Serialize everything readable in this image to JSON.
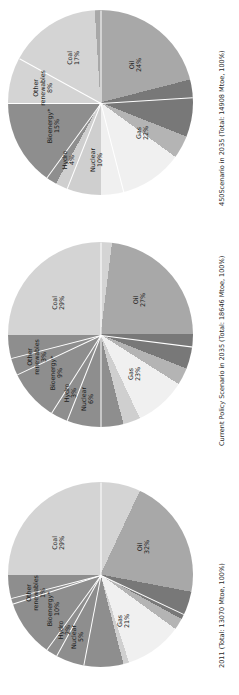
{
  "figure": {
    "orientation": "rotated-90-ccw",
    "background": "#ffffff",
    "footnote_marker": "*"
  },
  "palette": {
    "oil": "#d4d4d4",
    "gas": "#a8a8a8",
    "nuclear": "#787878",
    "hydro": "#b4b4b4",
    "bioenergy": "#f0f0f0",
    "other_renewables": "#cfcfcf",
    "coal": "#8e8e8e",
    "label_text": "#1b1b1b",
    "caption_text": "#2a2a2a",
    "slice_edge": "#ffffff"
  },
  "chart_data": [
    {
      "type": "pie",
      "id": "chart-450-scenario-2035",
      "title": "450Scenario in 2035 (Total: 14908 Mtoe, 100%)",
      "caption": "450Scenario in 2035 (Total: 14908 Mtoe, 100%)",
      "scenario": "450 Scenario",
      "year": "2035",
      "total": "14908",
      "total_unit": "Mtoe",
      "total_share": "100%",
      "categories": [
        "Oil",
        "Gas",
        "Nuclear",
        "Hydro",
        "Bioenergy*",
        "Other renewables",
        "Coal"
      ],
      "values": [
        24,
        22,
        10,
        4,
        15,
        8,
        17
      ],
      "labels": [
        {
          "name": "Oil",
          "value": "24%"
        },
        {
          "name": "Gas",
          "value": "22%"
        },
        {
          "name": "Nuclear",
          "value": "10%"
        },
        {
          "name": "Hydro",
          "value": "4%"
        },
        {
          "name": "Bioenergy*",
          "value": "15%"
        },
        {
          "name": "Other renewables",
          "value": "8%"
        },
        {
          "name": "Coal",
          "value": "17%"
        }
      ],
      "legend": "none",
      "grid": false
    },
    {
      "type": "pie",
      "id": "chart-current-policy-2035",
      "title": "Current Policy Scenario in 2035 (Total: 18646 Mtoe, 100%)",
      "caption": "Current Policy Scenario in 2035 (Total: 18646 Mtoe, 100%)",
      "scenario": "Current Policy Scenario",
      "year": "2035",
      "total": "18646",
      "total_unit": "Mtoe",
      "total_share": "100%",
      "categories": [
        "Oil",
        "Gas",
        "Nuclear",
        "Hydro",
        "Bioenergy*",
        "Other renewables",
        "Coal"
      ],
      "values": [
        27,
        23,
        6,
        3,
        9,
        3,
        29
      ],
      "labels": [
        {
          "name": "Oil",
          "value": "27%"
        },
        {
          "name": "Gas",
          "value": "23%"
        },
        {
          "name": "Nuclear",
          "value": "6%"
        },
        {
          "name": "Hydro",
          "value": "3%"
        },
        {
          "name": "Bioenergy*",
          "value": "9%"
        },
        {
          "name": "Other renewables",
          "value": "3%"
        },
        {
          "name": "Coal",
          "value": "29%"
        }
      ],
      "legend": "none",
      "grid": false
    },
    {
      "type": "pie",
      "id": "chart-2011-actual",
      "title": "2011 (Total: 13070 Mtoe, 100%)",
      "caption": "2011 (Total: 13070 Mtoe, 100%)",
      "scenario": "2011",
      "year": "2011",
      "total": "13070",
      "total_unit": "Mtoe",
      "total_share": "100%",
      "categories": [
        "Oil",
        "Gas",
        "Nuclear",
        "Hydro",
        "Bioenergy*",
        "Other renewables",
        "Coal"
      ],
      "values": [
        32,
        21,
        5,
        2,
        10,
        1,
        29
      ],
      "labels": [
        {
          "name": "Oil",
          "value": "32%"
        },
        {
          "name": "Gas",
          "value": "21%"
        },
        {
          "name": "Nuclear",
          "value": "5%"
        },
        {
          "name": "Hydro",
          "value": "2%"
        },
        {
          "name": "Bioenergy*",
          "value": "10%"
        },
        {
          "name": "Other renewables",
          "value": "1%"
        },
        {
          "name": "Coal",
          "value": "29%"
        }
      ],
      "legend": "none",
      "grid": false
    }
  ]
}
